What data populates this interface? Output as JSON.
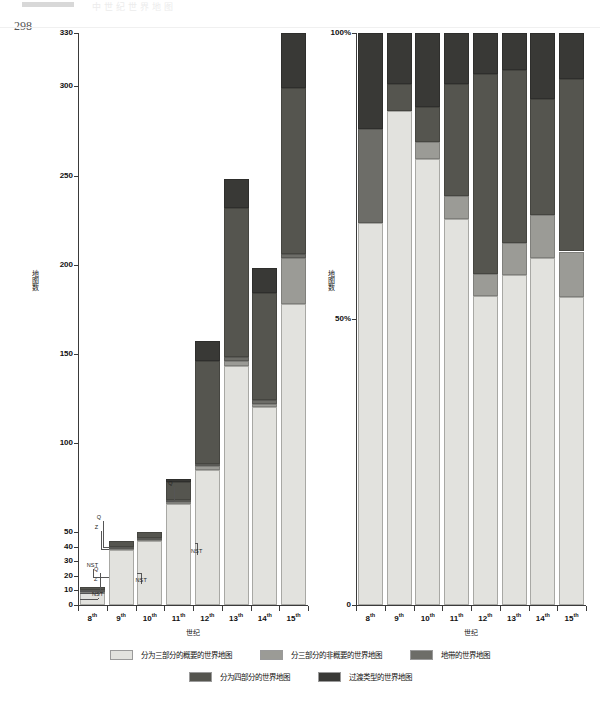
{
  "page": {
    "page_number": "298",
    "running_head": "中世纪世界地图"
  },
  "legend": {
    "position": "bottom",
    "rows": [
      [
        {
          "label": "分为三部分的概要的世界地图",
          "color": "#e2e2de",
          "key": "tripartite-schematic"
        },
        {
          "label": "分三部分的非概要的世界地图",
          "color": "#9b9b96",
          "key": "tripartite-nonschematic"
        },
        {
          "label": "地带的世界地图",
          "color": "#6d6d68",
          "key": "zonal"
        }
      ],
      [
        {
          "label": "分为四部分的世界地图",
          "color": "#55554f",
          "key": "quadripartite"
        },
        {
          "label": "过渡类型的世界地图",
          "color": "#393936",
          "key": "transitional"
        }
      ]
    ]
  },
  "annotations": {
    "q": "Q",
    "z": "Z",
    "nst": "NST"
  },
  "chart_data": [
    {
      "type": "bar",
      "id": "absolute-counts",
      "title": "",
      "stacked": true,
      "normalized": false,
      "xlabel": "世纪",
      "ylabel": "地图数",
      "categories": [
        "8th",
        "9th",
        "10th",
        "11th",
        "12th",
        "13th",
        "14th",
        "15th"
      ],
      "category_labels": [
        "8",
        "9",
        "10",
        "11",
        "12",
        "13",
        "14",
        "15"
      ],
      "category_suffix": "th",
      "ytick_labels": [
        "0",
        "10",
        "20",
        "30",
        "40",
        "50",
        "100",
        "150",
        "200",
        "250",
        "300",
        "330"
      ],
      "ytick_values": [
        0,
        10,
        20,
        30,
        40,
        50,
        100,
        150,
        200,
        250,
        300,
        330
      ],
      "ylim": [
        0,
        330
      ],
      "axis_note": "broken / expanded scale below 50",
      "grid": false,
      "series": [
        {
          "name": "分为三部分的概要的世界地图",
          "color": "#e2e2de",
          "values": [
            8,
            38,
            44,
            66,
            85,
            143,
            120,
            178
          ]
        },
        {
          "name": "分三部分的非概要的世界地图",
          "color": "#9b9b96",
          "values": [
            1,
            1,
            1,
            1,
            2,
            3,
            2,
            26
          ]
        },
        {
          "name": "地带的世界地图",
          "color": "#6d6d68",
          "values": [
            1,
            1,
            1,
            1,
            1,
            2,
            2,
            2
          ]
        },
        {
          "name": "分为四部分的世界地图",
          "color": "#55554f",
          "values": [
            2,
            4,
            4,
            10,
            58,
            84,
            60,
            93
          ]
        },
        {
          "name": "过渡类型的世界地图",
          "color": "#393936",
          "values": [
            0,
            0,
            0,
            2,
            11,
            16,
            14,
            31
          ]
        }
      ],
      "totals": [
        12,
        44,
        50,
        80,
        157,
        248,
        198,
        330
      ]
    },
    {
      "type": "bar",
      "id": "percentage-share",
      "title": "",
      "stacked": true,
      "normalized": true,
      "xlabel": "世纪",
      "ylabel": "地图数",
      "categories": [
        "8th",
        "9th",
        "10th",
        "11th",
        "12th",
        "13th",
        "14th",
        "15th"
      ],
      "ytick_labels": [
        "0",
        "50%",
        "100%"
      ],
      "ytick_values": [
        0,
        50,
        100
      ],
      "ylim": [
        0,
        100
      ],
      "grid": false,
      "series": [
        {
          "name": "分为三部分的概要的世界地图",
          "color": "#e2e2de",
          "values": [
            66.7,
            86.4,
            78.0,
            67.5,
            54.1,
            57.7,
            60.6,
            53.9
          ]
        },
        {
          "name": "分三部分的非概要的世界地图",
          "color": "#9b9b96",
          "values": [
            0.0,
            0.0,
            3.0,
            4.0,
            3.8,
            5.6,
            7.6,
            7.9
          ]
        },
        {
          "name": "地带的世界地图",
          "color": "#6d6d68",
          "values": [
            16.6,
            0.0,
            0.0,
            0.0,
            0.0,
            0.0,
            0.0,
            0.0
          ]
        },
        {
          "name": "分为四部分的世界地图",
          "color": "#55554f",
          "values": [
            0.0,
            4.6,
            6.0,
            19.5,
            35.0,
            30.2,
            20.2,
            30.2
          ]
        },
        {
          "name": "过渡类型的世界地图",
          "color": "#393936",
          "values": [
            16.7,
            9.0,
            13.0,
            9.0,
            7.1,
            6.5,
            11.6,
            8.0
          ]
        }
      ]
    }
  ]
}
